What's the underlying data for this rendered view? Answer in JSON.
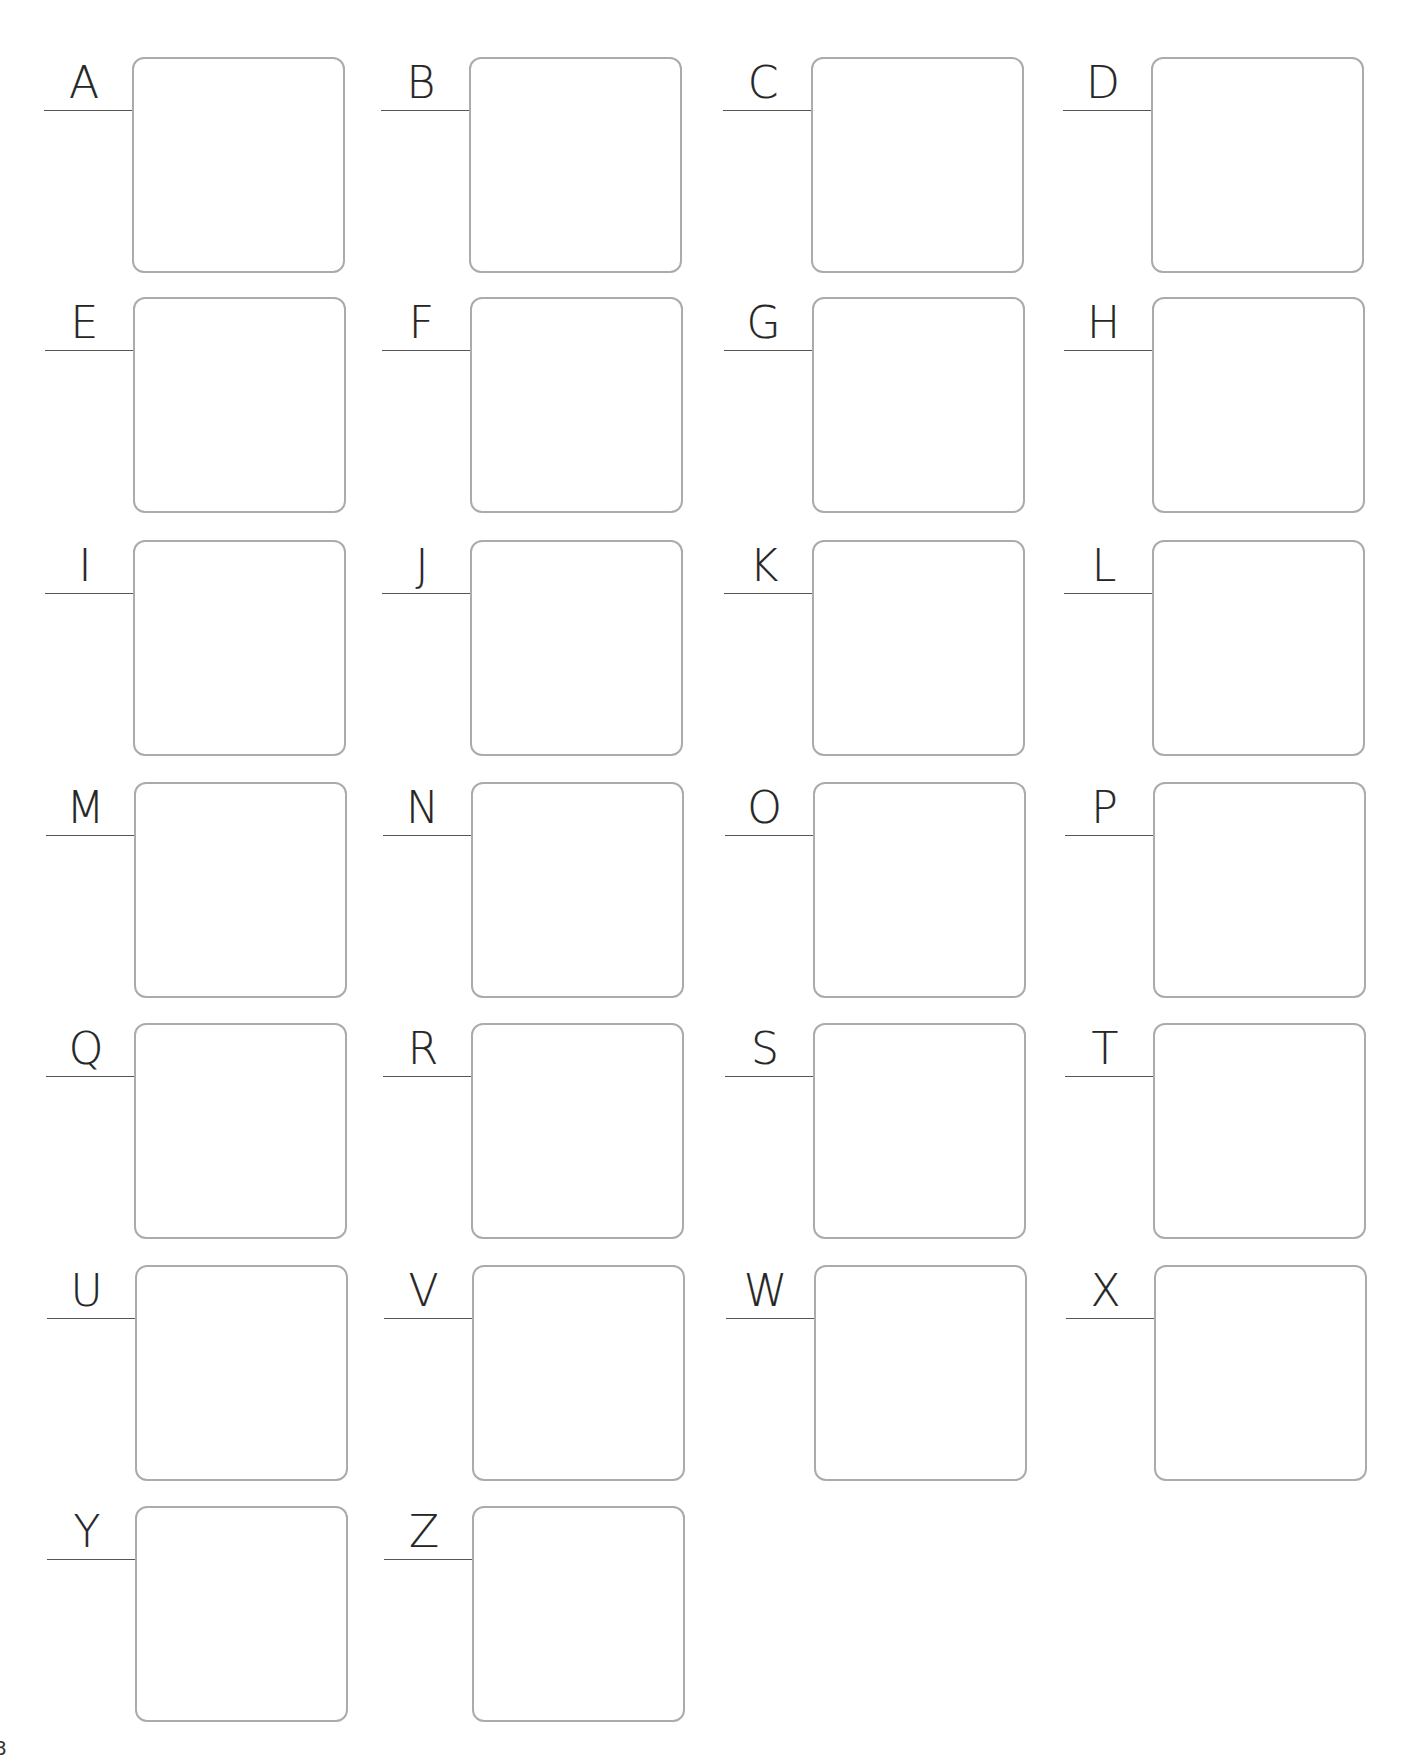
{
  "worksheet": {
    "layout": {
      "columns": 4,
      "col_box_left": [
        132,
        469,
        811,
        1151
      ],
      "row_box_top": [
        57,
        297,
        540,
        782,
        1023,
        1265,
        1506
      ],
      "col_drift_per_row": 0.5
    },
    "colors": {
      "box_border": "#ababab",
      "label_line": "#555555",
      "letter": "#262626"
    },
    "items": [
      {
        "letter": "A"
      },
      {
        "letter": "B"
      },
      {
        "letter": "C"
      },
      {
        "letter": "D"
      },
      {
        "letter": "E"
      },
      {
        "letter": "F"
      },
      {
        "letter": "G"
      },
      {
        "letter": "H"
      },
      {
        "letter": "I"
      },
      {
        "letter": "J"
      },
      {
        "letter": "K"
      },
      {
        "letter": "L"
      },
      {
        "letter": "M"
      },
      {
        "letter": "N"
      },
      {
        "letter": "O"
      },
      {
        "letter": "P"
      },
      {
        "letter": "Q"
      },
      {
        "letter": "R"
      },
      {
        "letter": "S"
      },
      {
        "letter": "T"
      },
      {
        "letter": "U"
      },
      {
        "letter": "V"
      },
      {
        "letter": "W"
      },
      {
        "letter": "X"
      },
      {
        "letter": "Y"
      },
      {
        "letter": "Z"
      }
    ]
  },
  "footer": {
    "page_number": "8"
  }
}
